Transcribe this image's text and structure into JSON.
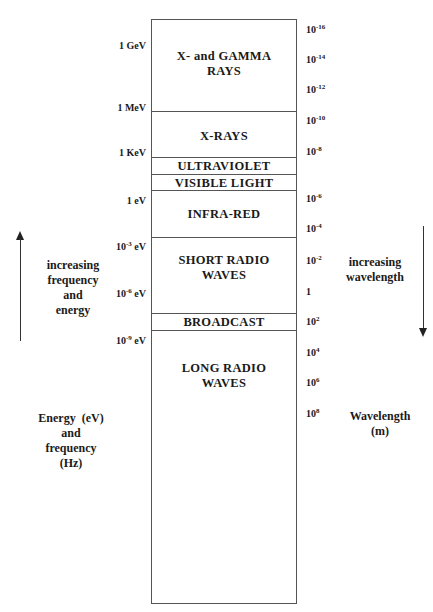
{
  "diagram": {
    "bands": [
      {
        "label_line1": "X- and GAMMA",
        "label_line2": "RAYS"
      },
      {
        "label_line1": "X-RAYS"
      },
      {
        "label_line1": "ULTRAVIOLET"
      },
      {
        "label_line1": "VISIBLE LIGHT"
      },
      {
        "label_line1": "INFRA-RED"
      },
      {
        "label_line1": "SHORT RADIO",
        "label_line2": "WAVES"
      },
      {
        "label_line1": "BROADCAST"
      },
      {
        "label_line1": "LONG RADIO",
        "label_line2": "WAVES"
      }
    ],
    "energy_ticks": [
      {
        "base": "1 GeV",
        "exp": ""
      },
      {
        "base": "1 MeV",
        "exp": ""
      },
      {
        "base": "1 KeV",
        "exp": ""
      },
      {
        "base": "1 eV",
        "exp": ""
      },
      {
        "base": "10",
        "exp": "-3",
        "unit": " eV"
      },
      {
        "base": "10",
        "exp": "-6",
        "unit": " eV"
      },
      {
        "base": "10",
        "exp": "-9",
        "unit": " eV"
      }
    ],
    "wavelength_ticks": [
      {
        "base": "10",
        "exp": "-16"
      },
      {
        "base": "10",
        "exp": "-14"
      },
      {
        "base": "10",
        "exp": "-12"
      },
      {
        "base": "10",
        "exp": "-10"
      },
      {
        "base": "10",
        "exp": "-8"
      },
      {
        "base": "10",
        "exp": "-6"
      },
      {
        "base": "10",
        "exp": "-4"
      },
      {
        "base": "10",
        "exp": "-2"
      },
      {
        "base": "1",
        "exp": ""
      },
      {
        "base": "10",
        "exp": "2"
      },
      {
        "base": "10",
        "exp": "4"
      },
      {
        "base": "10",
        "exp": "6"
      },
      {
        "base": "10",
        "exp": "8"
      }
    ],
    "left_annotation": {
      "lines": [
        "increasing",
        "frequency",
        "and",
        "energy"
      ]
    },
    "right_annotation": {
      "lines": [
        "increasing",
        "wavelength"
      ]
    },
    "left_axis_title": {
      "lines": [
        "Energy  (eV)",
        "and",
        "frequency",
        "(Hz)"
      ]
    },
    "right_axis_title": {
      "lines": [
        "Wavelength",
        "(m)"
      ]
    }
  }
}
